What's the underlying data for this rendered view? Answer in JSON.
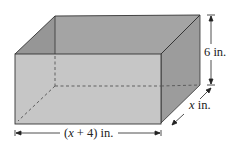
{
  "diagram": {
    "type": "rectangular box (open-top prism)",
    "labels": {
      "height": "6 in.",
      "depth_var": "x",
      "depth_unit": " in.",
      "length_open": "(",
      "length_var": "x",
      "length_rest": " + 4) in."
    },
    "colors": {
      "back_wall": "#a3a3a3",
      "left_wall": "#939393",
      "right_wall": "#9a9a9a",
      "front_face": "#c4c4c4",
      "edge": "#333333",
      "hidden_edge": "#555555"
    }
  }
}
